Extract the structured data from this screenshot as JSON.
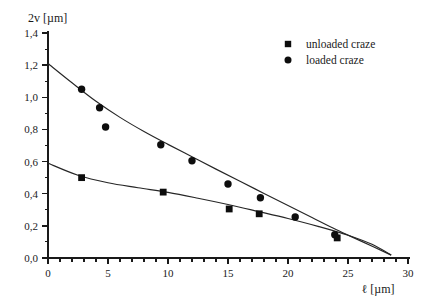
{
  "chart_data": {
    "type": "scatter",
    "title": "",
    "xlabel": "ℓ [µm]",
    "ylabel": "2v [µm]",
    "xlim": [
      0,
      30
    ],
    "ylim": [
      0.0,
      1.4
    ],
    "x_ticks": [
      0,
      5,
      10,
      15,
      20,
      25,
      30
    ],
    "x_tick_labels": [
      "0",
      "5",
      "10",
      "15",
      "20",
      "25",
      "30"
    ],
    "x_minor_step": 1,
    "y_ticks": [
      0.0,
      0.2,
      0.4,
      0.6,
      0.8,
      1.0,
      1.2,
      1.4
    ],
    "y_tick_labels": [
      "0,0",
      "0,2",
      "0,4",
      "0,6",
      "0,8",
      "1,0",
      "1,2",
      "1,4"
    ],
    "y_minor_step": 0.1,
    "grid": false,
    "legend_position": "top-right",
    "series": [
      {
        "name": "unloaded craze",
        "marker": "square",
        "color": "#0d0d0d",
        "points": [
          {
            "x": 2.8,
            "y": 0.5
          },
          {
            "x": 9.6,
            "y": 0.41
          },
          {
            "x": 15.1,
            "y": 0.305
          },
          {
            "x": 17.6,
            "y": 0.275
          },
          {
            "x": 24.1,
            "y": 0.125
          }
        ],
        "fit_curve": [
          {
            "x": 0.0,
            "y": 0.59
          },
          {
            "x": 2.5,
            "y": 0.515
          },
          {
            "x": 5.0,
            "y": 0.468
          },
          {
            "x": 7.5,
            "y": 0.437
          },
          {
            "x": 10.0,
            "y": 0.408
          },
          {
            "x": 12.5,
            "y": 0.372
          },
          {
            "x": 15.0,
            "y": 0.333
          },
          {
            "x": 17.5,
            "y": 0.29
          },
          {
            "x": 20.0,
            "y": 0.246
          },
          {
            "x": 22.5,
            "y": 0.197
          },
          {
            "x": 25.0,
            "y": 0.142
          },
          {
            "x": 27.0,
            "y": 0.085
          },
          {
            "x": 28.6,
            "y": 0.018
          }
        ]
      },
      {
        "name": "loaded craze",
        "marker": "circle",
        "color": "#0d0d0d",
        "points": [
          {
            "x": 2.8,
            "y": 1.05
          },
          {
            "x": 4.3,
            "y": 0.935
          },
          {
            "x": 4.8,
            "y": 0.815
          },
          {
            "x": 9.4,
            "y": 0.705
          },
          {
            "x": 12.0,
            "y": 0.605
          },
          {
            "x": 15.0,
            "y": 0.46
          },
          {
            "x": 17.7,
            "y": 0.375
          },
          {
            "x": 20.6,
            "y": 0.255
          },
          {
            "x": 23.9,
            "y": 0.145
          }
        ],
        "fit_curve": [
          {
            "x": 0.0,
            "y": 1.21
          },
          {
            "x": 2.0,
            "y": 1.09
          },
          {
            "x": 4.0,
            "y": 0.975
          },
          {
            "x": 6.0,
            "y": 0.875
          },
          {
            "x": 8.0,
            "y": 0.787
          },
          {
            "x": 10.0,
            "y": 0.707
          },
          {
            "x": 12.0,
            "y": 0.63
          },
          {
            "x": 14.0,
            "y": 0.553
          },
          {
            "x": 16.0,
            "y": 0.477
          },
          {
            "x": 18.0,
            "y": 0.402
          },
          {
            "x": 20.0,
            "y": 0.327
          },
          {
            "x": 22.0,
            "y": 0.252
          },
          {
            "x": 24.0,
            "y": 0.177
          },
          {
            "x": 26.0,
            "y": 0.108
          },
          {
            "x": 28.6,
            "y": 0.018
          }
        ]
      }
    ]
  },
  "legend": {
    "entries": [
      {
        "label": "unloaded craze",
        "marker": "square"
      },
      {
        "label": "loaded craze",
        "marker": "circle"
      }
    ]
  }
}
